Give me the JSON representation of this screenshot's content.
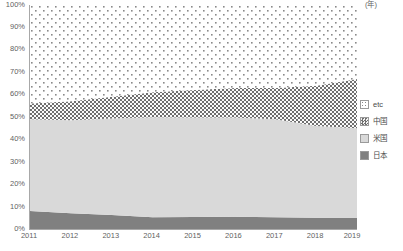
{
  "chart_data": {
    "type": "area",
    "title": "",
    "subtitle": "",
    "xlabel": "(年)",
    "ylabel": "",
    "stacked": true,
    "stack_mode": "percent",
    "grid": false,
    "legend_position": "right",
    "xlim": [
      2011,
      2019
    ],
    "ylim": [
      0,
      100
    ],
    "categories": [
      2011,
      2012,
      2013,
      2014,
      2015,
      2016,
      2017,
      2018,
      2019
    ],
    "x_tick_labels": [
      "2011",
      "2012",
      "2013",
      "2014",
      "2015",
      "2016",
      "2017",
      "2018",
      "2019"
    ],
    "x_unit_label": "(年)",
    "y_tick_labels": [
      "100%",
      "90%",
      "80%",
      "70%",
      "60%",
      "50%",
      "40%",
      "30%",
      "20%",
      "10%",
      "0%"
    ],
    "y_tick_values": [
      100,
      90,
      80,
      70,
      60,
      50,
      40,
      30,
      20,
      10,
      0
    ],
    "series": [
      {
        "name": "日本",
        "key": "japan",
        "fill": "#808080",
        "pattern": "solid",
        "values": [
          8.0,
          7.0,
          6.3,
          5.2,
          5.4,
          5.5,
          5.2,
          5.0,
          5.0
        ]
      },
      {
        "name": "米国",
        "key": "usa",
        "fill": "#d9d9d9",
        "pattern": "solid",
        "values": [
          41.0,
          41.5,
          43.0,
          44.7,
          44.4,
          44.3,
          43.8,
          41.0,
          40.0
        ]
      },
      {
        "name": "中国",
        "key": "china",
        "fill": "#8c8c8c",
        "pattern": "checker",
        "values": [
          7.0,
          8.5,
          9.7,
          11.1,
          12.2,
          13.2,
          14.0,
          18.0,
          22.0
        ]
      },
      {
        "name": "etc",
        "key": "etc",
        "fill": "#ffffff",
        "pattern": "dots",
        "values": [
          44.0,
          43.0,
          41.0,
          39.0,
          38.0,
          37.0,
          37.0,
          36.0,
          33.0
        ]
      }
    ],
    "cumulative_tops": {
      "japan": [
        8.0,
        7.0,
        6.3,
        5.2,
        5.4,
        5.5,
        5.2,
        5.0,
        5.0
      ],
      "usa": [
        49.0,
        48.5,
        49.3,
        49.9,
        49.8,
        49.8,
        49.0,
        46.0,
        45.0
      ],
      "china": [
        56.0,
        57.0,
        59.0,
        61.0,
        62.0,
        63.0,
        63.0,
        64.0,
        67.0
      ],
      "etc": [
        100,
        100,
        100,
        100,
        100,
        100,
        100,
        100,
        100
      ]
    },
    "legend_entries": [
      {
        "label": "etc",
        "pattern": "dots",
        "fill": "#ffffff"
      },
      {
        "label": "中国",
        "pattern": "checker",
        "fill": "#8c8c8c"
      },
      {
        "label": "米国",
        "pattern": "solid",
        "fill": "#d9d9d9"
      },
      {
        "label": "日本",
        "pattern": "solid",
        "fill": "#808080"
      }
    ],
    "colors": {
      "axis": "#a8a8a8",
      "text": "#5f5f5f",
      "japan": "#808080",
      "usa": "#d9d9d9",
      "china": "#8c8c8c",
      "etc": "#ffffff"
    }
  }
}
